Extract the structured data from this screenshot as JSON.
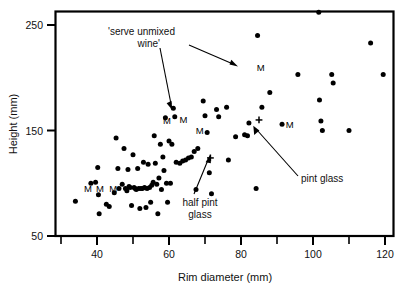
{
  "chart_data": {
    "type": "scatter",
    "title": "",
    "xlabel": "Rim diameter (mm)",
    "ylabel": "Height (mm)",
    "xlim": [
      30,
      122
    ],
    "ylim": [
      50,
      262
    ],
    "grid": false,
    "legend": null,
    "x_major_ticks": [
      40,
      60,
      80,
      100,
      120
    ],
    "x_minor_ticks": [
      30,
      50,
      70,
      90,
      110
    ],
    "y_major_ticks": [
      50,
      150,
      250
    ],
    "x_tick_labels": [
      "40",
      "60",
      "80",
      "100",
      "120"
    ],
    "y_tick_labels": [
      "50",
      "150",
      "250"
    ],
    "series": [
      {
        "name": "vessels",
        "marker": "filled-circle",
        "points": [
          [
            34.0,
            83.0
          ],
          [
            38.3,
            100.0
          ],
          [
            39.6,
            101.0
          ],
          [
            40.2,
            115.0
          ],
          [
            40.4,
            89.0
          ],
          [
            40.6,
            71.0
          ],
          [
            42.6,
            80.0
          ],
          [
            43.4,
            78.0
          ],
          [
            44.8,
            91.0
          ],
          [
            45.3,
            143.0
          ],
          [
            45.8,
            114.0
          ],
          [
            46.1,
            95.0
          ],
          [
            47.0,
            99.0
          ],
          [
            47.5,
            133.0
          ],
          [
            47.9,
            95.0
          ],
          [
            48.3,
            93.0
          ],
          [
            48.6,
            113.0
          ],
          [
            48.9,
            97.0
          ],
          [
            49.2,
            96.0
          ],
          [
            49.6,
            79.0
          ],
          [
            50.0,
            127.0
          ],
          [
            50.3,
            96.0
          ],
          [
            50.6,
            95.0
          ],
          [
            50.9,
            94.0
          ],
          [
            51.3,
            114.0
          ],
          [
            51.6,
            95.0
          ],
          [
            51.9,
            76.0
          ],
          [
            52.2,
            95.0
          ],
          [
            52.6,
            95.0
          ],
          [
            52.9,
            120.0
          ],
          [
            53.2,
            96.0
          ],
          [
            53.6,
            77.0
          ],
          [
            53.9,
            95.0
          ],
          [
            54.2,
            118.0
          ],
          [
            54.6,
            96.0
          ],
          [
            54.9,
            82.0
          ],
          [
            55.2,
            98.0
          ],
          [
            55.6,
            101.0
          ],
          [
            55.9,
            145.0
          ],
          [
            56.2,
            119.0
          ],
          [
            56.6,
            99.0
          ],
          [
            56.9,
            71.0
          ],
          [
            57.2,
            105.0
          ],
          [
            57.6,
            137.0
          ],
          [
            57.9,
            94.0
          ],
          [
            58.3,
            125.0
          ],
          [
            58.6,
            112.0
          ],
          [
            59.0,
            162.0
          ],
          [
            59.3,
            100.0
          ],
          [
            59.6,
            82.0
          ],
          [
            60.0,
            140.0
          ],
          [
            60.4,
            100.0
          ],
          [
            60.8,
            137.0
          ],
          [
            61.2,
            171.0
          ],
          [
            61.6,
            163.0
          ],
          [
            62.0,
            120.0
          ],
          [
            63.0,
            119.0
          ],
          [
            63.8,
            121.0
          ],
          [
            64.6,
            122.0
          ],
          [
            65.4,
            124.0
          ],
          [
            66.2,
            125.0
          ],
          [
            67.0,
            130.0
          ],
          [
            67.5,
            94.0
          ],
          [
            68.0,
            133.0
          ],
          [
            69.5,
            178.0
          ],
          [
            70.0,
            164.0
          ],
          [
            70.6,
            148.0
          ],
          [
            71.2,
            110.0
          ],
          [
            71.8,
            90.0
          ],
          [
            73.2,
            170.0
          ],
          [
            73.8,
            163.0
          ],
          [
            76.0,
            172.0
          ],
          [
            76.5,
            122.0
          ],
          [
            78.5,
            144.0
          ],
          [
            81.0,
            146.0
          ],
          [
            81.8,
            145.0
          ],
          [
            82.2,
            157.0
          ],
          [
            84.2,
            95.0
          ],
          [
            84.6,
            240.0
          ],
          [
            85.8,
            172.0
          ],
          [
            88.0,
            186.0
          ],
          [
            91.4,
            156.0
          ],
          [
            95.8,
            203.0
          ],
          [
            101.6,
            262.0
          ],
          [
            101.8,
            179.0
          ],
          [
            102.2,
            159.0
          ],
          [
            102.6,
            150.0
          ],
          [
            105.2,
            203.0
          ],
          [
            105.6,
            195.0
          ],
          [
            110.0,
            150.0
          ],
          [
            116.0,
            233.0
          ],
          [
            119.5,
            203.0
          ]
        ]
      },
      {
        "name": "reference glasses",
        "marker": "plus",
        "points": [
          [
            71.5,
            124.0
          ],
          [
            85.0,
            160.0
          ]
        ]
      }
    ],
    "point_labels": [
      {
        "text": "M",
        "x": 37.5,
        "y": 92.0
      },
      {
        "text": "M",
        "x": 40.8,
        "y": 92.0
      },
      {
        "text": "M",
        "x": 44.5,
        "y": 92.0
      },
      {
        "text": "M",
        "x": 59.4,
        "y": 156.0
      },
      {
        "text": "M",
        "x": 64.0,
        "y": 157.0
      },
      {
        "text": "M",
        "x": 68.5,
        "y": 147.0
      },
      {
        "text": "M",
        "x": 85.5,
        "y": 206.0
      },
      {
        "text": "M",
        "x": 93.5,
        "y": 152.0
      }
    ],
    "annotations": [
      {
        "id": "serve-unmixed-wine",
        "lines": [
          "'serve unmixed",
          "wine'"
        ],
        "targets": [
          "M at (85.5, 206)",
          "M at (59.4, 156)"
        ]
      },
      {
        "id": "half-pint-glass",
        "lines": [
          "half pint",
          "glass"
        ],
        "targets": [
          "plus at (71.5, 124)"
        ]
      },
      {
        "id": "pint-glass",
        "lines": [
          "pint glass"
        ],
        "targets": [
          "plus at (85.0, 160)"
        ]
      }
    ]
  },
  "axes": {
    "x_title": "Rim diameter (mm)",
    "y_title": "Height (mm)",
    "x_ticks": [
      "40",
      "60",
      "80",
      "100",
      "120"
    ],
    "y_ticks": [
      "250",
      "150",
      "50"
    ]
  },
  "annotations": {
    "serve_unmixed_line1": "'serve unmixed",
    "serve_unmixed_line2": "wine'",
    "half_pint_line1": "half pint",
    "half_pint_line2": "glass",
    "pint_glass": "pint glass",
    "marker_letter": "M"
  },
  "colors": {
    "background": "#ffffff",
    "ink": "#000000",
    "text": "#111111"
  }
}
